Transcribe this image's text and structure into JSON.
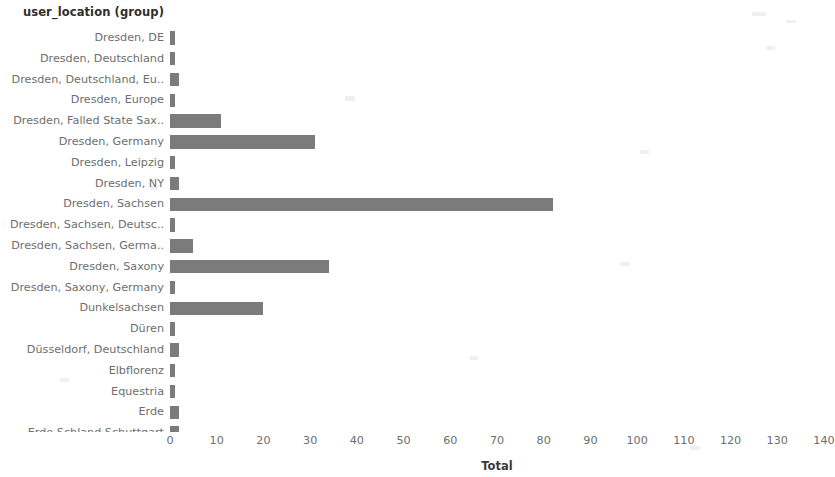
{
  "chart_data": {
    "type": "bar",
    "orientation": "horizontal",
    "title": "",
    "dimension_header": "user_location (group)",
    "xlabel": "Total",
    "ylabel": "",
    "xlim": [
      0,
      140
    ],
    "xticks": [
      0,
      10,
      20,
      30,
      40,
      50,
      60,
      70,
      80,
      90,
      100,
      110,
      120,
      130,
      140
    ],
    "grid": false,
    "legend": false,
    "bar_color": "#7b7b7b",
    "label_color": "#6e6e6e",
    "categories": [
      "Dresden, DE",
      "Dresden, Deutschland",
      "Dresden, Deutschland, Eu..",
      "Dresden, Europe",
      "Dresden, Falled State Sax..",
      "Dresden, Germany",
      "Dresden, Leipzig",
      "Dresden, NY",
      "Dresden, Sachsen",
      "Dresden, Sachsen, Deutsc..",
      "Dresden, Sachsen, Germa..",
      "Dresden, Saxony",
      "Dresden, Saxony, Germany",
      "Dunkelsachsen",
      "Düren",
      "Düsseldorf, Deutschland",
      "Elbflorenz",
      "Equestria",
      "Erde",
      "Erde Schland Schuttgart",
      "Erfurt"
    ],
    "values": [
      1,
      1,
      2,
      1,
      11,
      31,
      1,
      2,
      82,
      1,
      5,
      34,
      1,
      20,
      1,
      2,
      1,
      1,
      2,
      2,
      2
    ]
  }
}
